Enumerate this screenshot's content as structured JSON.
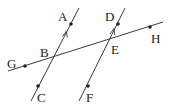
{
  "diagram": {
    "title": "",
    "colors": {
      "line": "#3a3a3a",
      "text": "#222222",
      "background": "#ffffff"
    },
    "points": {
      "A": {
        "label": "A",
        "x": 71,
        "y": 24,
        "lx": 58,
        "ly": 21
      },
      "B": {
        "label": "B",
        "x": 54,
        "y": 57,
        "lx": 41,
        "ly": 57
      },
      "C": {
        "label": "C",
        "x": 38,
        "y": 86,
        "lx": 37,
        "ly": 102
      },
      "D": {
        "label": "D",
        "x": 118,
        "y": 24,
        "lx": 105,
        "ly": 21
      },
      "E": {
        "label": "E",
        "x": 108,
        "y": 40,
        "lx": 111,
        "ly": 54
      },
      "F": {
        "label": "F",
        "x": 88,
        "y": 86,
        "lx": 86,
        "ly": 102
      },
      "G": {
        "label": "G",
        "x": 25,
        "y": 66,
        "lx": 8,
        "ly": 68
      },
      "H": {
        "label": "H",
        "x": 150,
        "y": 27,
        "lx": 151,
        "ly": 43
      }
    },
    "lines": [
      {
        "name": "line-AC",
        "x1": 31,
        "y1": 101,
        "x2": 79,
        "y2": 8
      },
      {
        "name": "line-DF",
        "x1": 79,
        "y1": 101,
        "x2": 125,
        "y2": 8
      },
      {
        "name": "line-GH",
        "x1": 8,
        "y1": 71,
        "x2": 163,
        "y2": 22
      }
    ],
    "labels": [
      "A",
      "B",
      "C",
      "D",
      "E",
      "F",
      "G",
      "H"
    ]
  }
}
